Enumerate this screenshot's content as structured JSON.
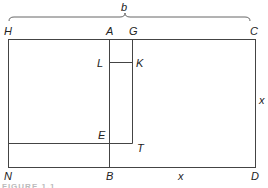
{
  "diagram": {
    "labels": {
      "b": "b",
      "H": "H",
      "A": "A",
      "G": "G",
      "C": "C",
      "L": "L",
      "K": "K",
      "E": "E",
      "T": "T",
      "N": "N",
      "B": "B",
      "D": "D",
      "x_bottom": "x",
      "x_right": "x"
    },
    "caption": "FIGURE 1.1",
    "colors": {
      "line": "#444444",
      "text": "#222222"
    }
  }
}
